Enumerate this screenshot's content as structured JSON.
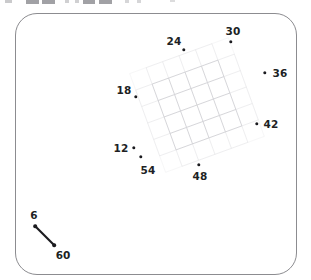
{
  "figure": {
    "kind": "scatter-with-mesh-overlay",
    "background_color": "#ffffff",
    "frame": {
      "shape": "rounded-rectangle",
      "border_color": "#8c8c90",
      "corner_radius": "22px"
    },
    "mesh": {
      "description": "faint rotated square grid overlay",
      "line_color": "#cfcfd4",
      "rotation_deg": -20,
      "rows": 6,
      "cols": 6
    }
  },
  "points": [
    {
      "label": "24",
      "x": 184,
      "y": 50,
      "label_x": 174,
      "label_y": 41
    },
    {
      "label": "30",
      "x": 231,
      "y": 42,
      "label_x": 233,
      "label_y": 31
    },
    {
      "label": "36",
      "x": 265,
      "y": 73,
      "label_x": 280,
      "label_y": 73
    },
    {
      "label": "42",
      "x": 257,
      "y": 124,
      "label_x": 271,
      "label_y": 124
    },
    {
      "label": "48",
      "x": 199,
      "y": 165,
      "label_x": 200,
      "label_y": 176
    },
    {
      "label": "54",
      "x": 141,
      "y": 157,
      "label_x": 148,
      "label_y": 170
    },
    {
      "label": "12",
      "x": 134,
      "y": 148,
      "label_x": 121,
      "label_y": 148
    },
    {
      "label": "18",
      "x": 136,
      "y": 97,
      "label_x": 124,
      "label_y": 90
    }
  ],
  "scale_legend": {
    "name": "scale-bar",
    "start": {
      "label": "6",
      "dot_x": 13,
      "dot_y": 18,
      "label_x": 12,
      "label_y": 7
    },
    "end": {
      "label": "60",
      "dot_x": 32,
      "dot_y": 37,
      "label_x": 41,
      "label_y": 47
    },
    "line_color": "#1b1b1f"
  },
  "top_clip_fragments": [
    {
      "left": 5,
      "width": 7,
      "height": 3,
      "opacity": 0.45
    },
    {
      "left": 26,
      "width": 13,
      "height": 4,
      "opacity": 0.8
    },
    {
      "left": 42,
      "width": 13,
      "height": 4,
      "opacity": 0.8
    },
    {
      "left": 65,
      "width": 4,
      "height": 3,
      "opacity": 0.4
    },
    {
      "left": 75,
      "width": 4,
      "height": 3,
      "opacity": 0.4
    },
    {
      "left": 83,
      "width": 12,
      "height": 4,
      "opacity": 0.8
    },
    {
      "left": 99,
      "width": 13,
      "height": 4,
      "opacity": 0.8
    },
    {
      "left": 125,
      "width": 4,
      "height": 3,
      "opacity": 0.35
    },
    {
      "left": 137,
      "width": 4,
      "height": 3,
      "opacity": 0.35
    },
    {
      "left": 170,
      "width": 5,
      "height": 2,
      "opacity": 0.3
    }
  ],
  "chart_data": {
    "type": "scatter",
    "title": "",
    "xlabel": "",
    "ylabel": "",
    "grid": true,
    "legend_position": "bottom-left",
    "annotations": [
      "6",
      "60"
    ],
    "point_labels": [
      "24",
      "30",
      "36",
      "42",
      "48",
      "54",
      "12",
      "18"
    ],
    "points": [
      {
        "label": "24",
        "px": 184,
        "py": 50
      },
      {
        "label": "30",
        "px": 231,
        "py": 42
      },
      {
        "label": "36",
        "px": 265,
        "py": 73
      },
      {
        "label": "42",
        "px": 257,
        "py": 124
      },
      {
        "label": "48",
        "px": 199,
        "py": 165
      },
      {
        "label": "54",
        "px": 141,
        "py": 157
      },
      {
        "label": "12",
        "px": 134,
        "py": 148
      },
      {
        "label": "18",
        "px": 136,
        "py": 97
      }
    ]
  }
}
